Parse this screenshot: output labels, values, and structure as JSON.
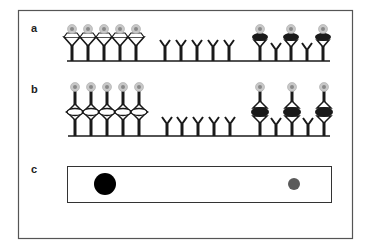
{
  "figure": {
    "panels": [
      {
        "label": "a",
        "description": "Capture antibodies on surface; left group bound with labeled antigen (open triangle binder), right group bound with labeled antigen (filled binder) interleaved with free antibodies",
        "left_group": {
          "count": 5,
          "binder_style": "open",
          "has_label": true
        },
        "middle_group": {
          "count": 5,
          "binder_style": "none",
          "has_label": false
        },
        "right_group": [
          {
            "binder_style": "filled",
            "has_label": true
          },
          {
            "binder_style": "none",
            "has_label": false
          },
          {
            "binder_style": "filled",
            "has_label": true
          },
          {
            "binder_style": "none",
            "has_label": false
          },
          {
            "binder_style": "filled",
            "has_label": true
          }
        ]
      },
      {
        "label": "b",
        "description": "Sandwich complexes: capture antibody, antigen (open or filled), detection antibody with label",
        "left_group": {
          "count": 5,
          "binder_style": "open",
          "has_label": true
        },
        "middle_group": {
          "count": 5,
          "binder_style": "none",
          "has_label": false
        },
        "right_group": [
          {
            "binder_style": "filled",
            "has_label": true
          },
          {
            "binder_style": "none",
            "has_label": false
          },
          {
            "binder_style": "filled",
            "has_label": true
          },
          {
            "binder_style": "none",
            "has_label": false
          },
          {
            "binder_style": "filled",
            "has_label": true
          }
        ]
      },
      {
        "label": "c",
        "description": "Strip with two spots: large dark spot and small faint spot",
        "spots": [
          {
            "name": "strong-spot",
            "intensity": "strong",
            "color": "#000000"
          },
          {
            "name": "weak-spot",
            "intensity": "weak",
            "color": "#5a5a5a"
          }
        ]
      }
    ],
    "colors": {
      "ink": "#1a1a1a",
      "frame": "#555555",
      "label_outer": "#c8c8c8",
      "label_inner": "#888888"
    }
  }
}
